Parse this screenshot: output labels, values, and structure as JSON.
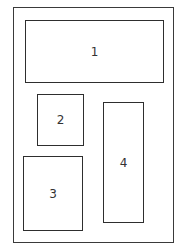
{
  "diagram": {
    "type": "page-layout",
    "frame": {
      "x": 13,
      "y": 7,
      "w": 161,
      "h": 236
    },
    "boxes": [
      {
        "label": "1",
        "x": 25,
        "y": 20,
        "w": 139,
        "h": 63
      },
      {
        "label": "2",
        "x": 37,
        "y": 94,
        "w": 47,
        "h": 52
      },
      {
        "label": "3",
        "x": 23,
        "y": 156,
        "w": 60,
        "h": 75
      },
      {
        "label": "4",
        "x": 103,
        "y": 102,
        "w": 41,
        "h": 121
      }
    ],
    "colors": {
      "stroke": "#2e2e2e",
      "background": "#ffffff",
      "text": "#333333"
    }
  }
}
